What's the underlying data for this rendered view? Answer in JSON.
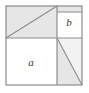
{
  "figure": {
    "type": "geometric-area-diagram",
    "width": 89,
    "height": 93,
    "colors": {
      "shaded_fill": "#e6e6e6",
      "light_fill": "#f2f2f2",
      "white_fill": "#ffffff",
      "outline": "#8c8c8c",
      "diagonal": "#8c8c8c",
      "label": "#3a3a3a",
      "background": "#ffffff"
    },
    "outer_square": {
      "x": 6,
      "y": 6,
      "width": 76,
      "height": 79
    },
    "dividers": {
      "vertical_x": 57,
      "horizontal_y": 38
    },
    "regions": [
      {
        "name": "top-left",
        "fill": "shaded",
        "label": "",
        "diagonal": "bottom-left-to-top-right"
      },
      {
        "name": "top-right",
        "fill": "white",
        "label": "b",
        "diagonal": "none"
      },
      {
        "name": "bottom-left",
        "fill": "white",
        "label": "a",
        "diagonal": "none"
      },
      {
        "name": "bottom-right",
        "fill": "shaded",
        "label": "",
        "diagonal": "top-left-to-bottom-right"
      }
    ],
    "labels": {
      "a": {
        "text": "a",
        "x": 31,
        "y": 62
      },
      "b": {
        "text": "b",
        "x": 69,
        "y": 22
      }
    }
  }
}
